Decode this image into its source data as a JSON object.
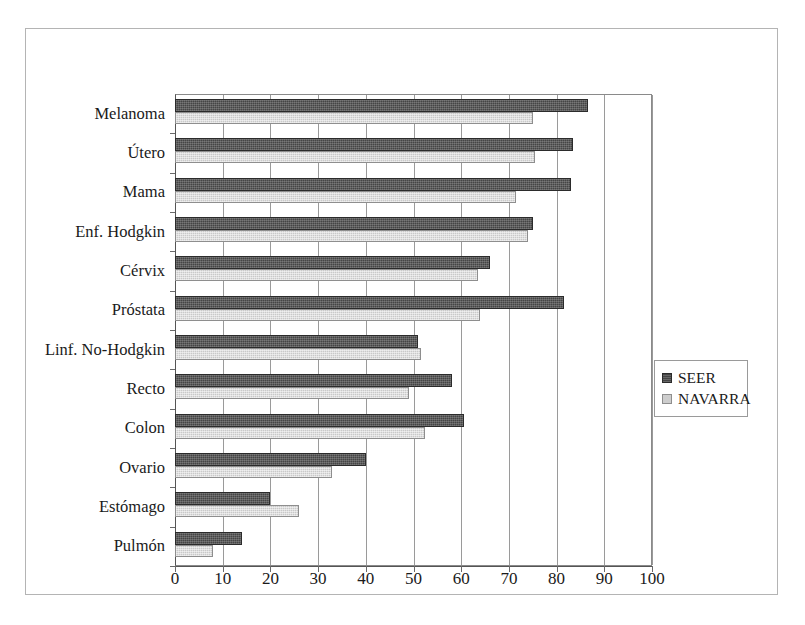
{
  "chart_data": {
    "type": "bar",
    "orientation": "horizontal",
    "title": "",
    "xlabel": "",
    "ylabel": "",
    "xlim": [
      0,
      100
    ],
    "xticks": [
      0,
      10,
      20,
      30,
      40,
      50,
      60,
      70,
      80,
      90,
      100
    ],
    "grid": true,
    "legend_position": "right",
    "categories": [
      "Melanoma",
      "Útero",
      "Mama",
      "Enf. Hodgkin",
      "Cérvix",
      "Próstata",
      "Linf. No-Hodgkin",
      "Recto",
      "Colon",
      "Ovario",
      "Estómago",
      "Pulmón"
    ],
    "series": [
      {
        "name": "SEER",
        "color": "#454545",
        "values": [
          86.5,
          83.5,
          83,
          75,
          66,
          81.5,
          51,
          58,
          60.5,
          40,
          20,
          14
        ]
      },
      {
        "name": "NAVARRA",
        "color": "#c9c9c9",
        "values": [
          75,
          75.5,
          71.5,
          74,
          63.5,
          64,
          51.5,
          49,
          52.5,
          33,
          26,
          8
        ]
      }
    ]
  },
  "legend": {
    "items": [
      {
        "label": "SEER"
      },
      {
        "label": "NAVARRA"
      }
    ]
  }
}
